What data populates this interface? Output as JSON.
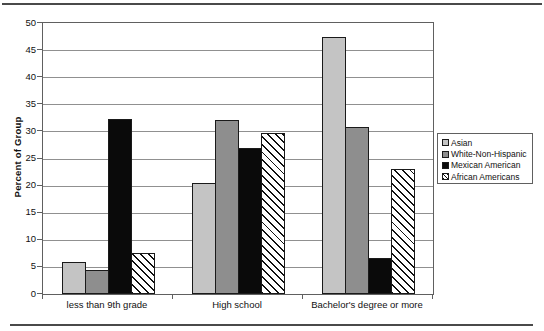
{
  "figure": {
    "background": "#ffffff",
    "rule_color": "#4a4a4a"
  },
  "chart_data": {
    "type": "bar",
    "title": "",
    "categories": [
      "less than 9th grade",
      "High school",
      "Bachelor's degree or more"
    ],
    "series": [
      {
        "name": "Asian",
        "values": [
          6.0,
          20.4,
          47.4
        ],
        "fill": "#c4c4c4",
        "pattern": "solid"
      },
      {
        "name": "White-Non-Hispanic",
        "values": [
          4.4,
          32.2,
          30.8
        ],
        "fill": "#8e8e8e",
        "pattern": "solid"
      },
      {
        "name": "Mexican American",
        "values": [
          32.3,
          26.9,
          6.7
        ],
        "fill": "#0a0a0a",
        "pattern": "solid"
      },
      {
        "name": "African Americans",
        "values": [
          7.5,
          29.8,
          23.1
        ],
        "fill": "#ffffff",
        "pattern": "diagonal-hatch"
      }
    ],
    "xlabel": "",
    "ylabel": "Percent of Group",
    "ylim": [
      0,
      50
    ],
    "ytick_step": 5,
    "yticks": [
      0,
      5,
      10,
      15,
      20,
      25,
      30,
      35,
      40,
      45,
      50
    ],
    "grid": true,
    "legend_position": "right",
    "legend_entries": [
      "Asian",
      "White-Non-Hispanic",
      "Mexican American",
      "African Americans"
    ],
    "colors": {
      "gridline": "#909090",
      "axis": "#606060",
      "bar_border": "#1a1a1a",
      "hatch_line": "#111111",
      "text": "#111111"
    }
  }
}
